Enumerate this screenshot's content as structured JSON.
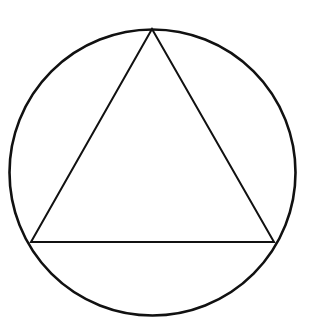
{
  "diagram": {
    "title": "Equilateral triangle inscribed in a circle",
    "stroke_color": "#111111",
    "background_color": "#ffffff",
    "circle": {
      "cx": 152.5,
      "cy": 172.5,
      "r": 143,
      "stroke_width": 2.6
    },
    "triangle": {
      "vertices": [
        {
          "name": "top",
          "x": 152,
          "y": 29
        },
        {
          "name": "bottom-left",
          "x": 31,
          "y": 242
        },
        {
          "name": "bottom-right",
          "x": 274,
          "y": 242
        }
      ],
      "stroke_width": 2
    }
  }
}
